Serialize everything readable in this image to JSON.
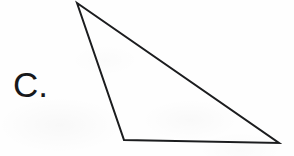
{
  "page": {
    "width": 294,
    "height": 156,
    "background_color": "#ffffff",
    "paper_tint": "#fefefe"
  },
  "label": {
    "text": "C.",
    "color": "#17181a",
    "x": 13,
    "y": 66
  },
  "figure": {
    "name": "triangle",
    "kind": "scalene-obtuse-triangle",
    "stroke_color": "#1b1c1e",
    "fill": "none",
    "stroke_width": 2,
    "vertices": [
      {
        "name": "apex",
        "x": 77,
        "y": 3
      },
      {
        "name": "bottom-left",
        "x": 124,
        "y": 140
      },
      {
        "name": "bottom-right",
        "x": 279,
        "y": 143
      }
    ],
    "edges": [
      {
        "name": "left-edge",
        "from": "apex",
        "to": "bottom-left"
      },
      {
        "name": "bottom-edge",
        "from": "bottom-left",
        "to": "bottom-right"
      },
      {
        "name": "hypotenuse",
        "from": "bottom-right",
        "to": "apex"
      }
    ],
    "points_attr": "77,3 124,140 279,143"
  }
}
